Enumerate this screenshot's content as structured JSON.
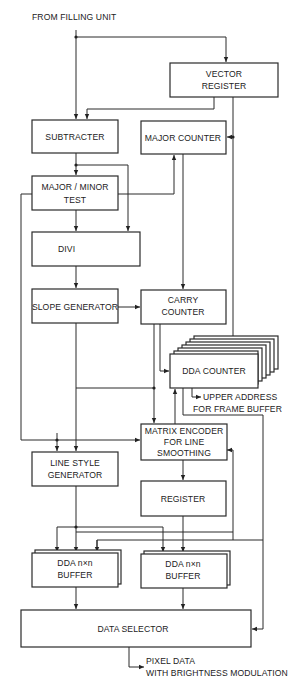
{
  "diagram": {
    "input_label": "FROM FILLING UNIT",
    "output_label_line1": "PIXEL DATA",
    "output_label_line2": "WITH BRIGHTNESS MODULATION",
    "side_output_line1": "UPPER ADDRESS",
    "side_output_line2": "FOR FRAME BUFFER",
    "blocks": {
      "vector_register": {
        "line1": "VECTOR",
        "line2": "REGISTER"
      },
      "subtracter": {
        "line1": "SUBTRACTER"
      },
      "major_counter": {
        "line1": "MAJOR COUNTER"
      },
      "major_minor_test": {
        "line1": "MAJOR / MINOR",
        "line2": "TEST"
      },
      "divi": {
        "line1": "DIVI"
      },
      "slope_generator": {
        "line1": "SLOPE GENERATOR"
      },
      "carry_counter": {
        "line1": "CARRY",
        "line2": "COUNTER"
      },
      "dda_counter": {
        "line1": "DDA COUNTER"
      },
      "matrix_encoder": {
        "line1": "MATRIX ENCODER",
        "line2": "FOR LINE",
        "line3": "SMOOTHING"
      },
      "line_style_generator": {
        "line1": "LINE STYLE",
        "line2": "GENERATOR"
      },
      "register": {
        "line1": "REGISTER"
      },
      "dda_buffer_left": {
        "line1": "DDA n×n",
        "line2": "BUFFER"
      },
      "dda_buffer_right": {
        "line1": "DDA n×n",
        "line2": "BUFFER"
      },
      "data_selector": {
        "line1": "DATA SELECTOR"
      }
    },
    "colors": {
      "line": "#2a2a2a",
      "background": "#ffffff",
      "text": "#222222"
    }
  }
}
